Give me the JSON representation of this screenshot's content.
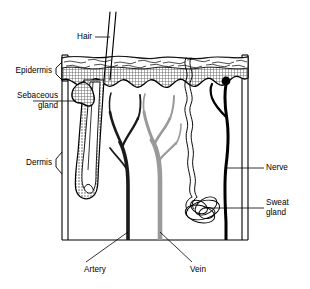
{
  "figure": {
    "background_color": "#ffffff",
    "ink_color": "#000000",
    "width": 310,
    "height": 289
  },
  "labels": {
    "hair": "Hair",
    "epidermis": "Epidermis",
    "sebaceous_gland_line1": "Sebaceous",
    "sebaceous_gland_line2": "gland",
    "dermis": "Dermis",
    "nerve": "Nerve",
    "sweat_gland_line1": "Sweat",
    "sweat_gland_line2": "gland",
    "artery": "Artery",
    "vein": "Vein"
  },
  "structures": [
    {
      "name": "hair-shaft",
      "label": "Hair",
      "description": "Two parallel lines angled up-right emerging above the skin surface",
      "color": "#000000"
    },
    {
      "name": "epidermis-layer",
      "label": "Epidermis",
      "description": "Top band with flaky stratum corneum over a gray crosshatch fill and an undulating lower boundary",
      "fill_color": "#8c8c8c",
      "outline_color": "#000000"
    },
    {
      "name": "sebaceous-gland",
      "label": "Sebaceous gland",
      "description": "Lobed gland attached to the upper hair follicle",
      "color": "#000000"
    },
    {
      "name": "dermis-layer",
      "label": "Dermis",
      "description": "Large white region below the epidermis containing follicle, vessels, nerve and sweat gland",
      "fill_color": "#ffffff"
    },
    {
      "name": "hair-follicle",
      "label": "Hair follicle",
      "description": "Elongated stippled tube with a bulb at its deep end",
      "color": "#000000"
    },
    {
      "name": "artery",
      "label": "Artery",
      "description": "Dark branching vessel ascending through the dermis",
      "color": "#1a1a1a"
    },
    {
      "name": "vein",
      "label": "Vein",
      "description": "Light gray branching vessel ascending through the dermis",
      "color": "#9a9a9a"
    },
    {
      "name": "sweat-duct",
      "label": "Sweat duct",
      "description": "Wavy double-lined tube running from the skin surface to the sweat gland",
      "color": "#000000"
    },
    {
      "name": "sweat-gland",
      "label": "Sweat gland",
      "description": "Tangled coil of tubular loops deep in the dermis",
      "color": "#000000"
    },
    {
      "name": "nerve",
      "label": "Nerve",
      "description": "Thick dark fibre with a bulbous ending at the epidermal border and one branch",
      "color": "#000000"
    }
  ],
  "colors": {
    "ink": "#000000",
    "epidermis_fill": "#8c8c8c",
    "artery": "#1a1a1a",
    "vein": "#9a9a9a",
    "background": "#ffffff"
  }
}
